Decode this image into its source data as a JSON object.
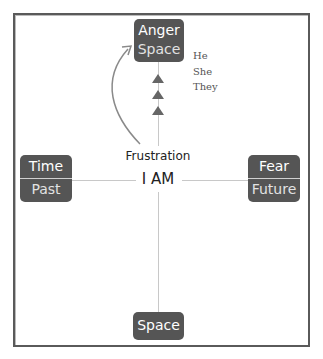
{
  "diagram": {
    "top_box": {
      "line1": "Anger",
      "line2": "Space"
    },
    "left_box": {
      "line1": "Time",
      "line2": "Past"
    },
    "right_box": {
      "line1": "Fear",
      "line2": "Future"
    },
    "bottom_box": {
      "line1": "Space"
    },
    "pronouns": [
      "He",
      "She",
      "They"
    ],
    "center": {
      "emotion": "Frustration",
      "self": "I AM"
    },
    "arrow_count": 3,
    "colors": {
      "box": "#555555",
      "line": "#c8c8c8",
      "frame": "#5a5a5a",
      "arrow": "#666666"
    }
  }
}
